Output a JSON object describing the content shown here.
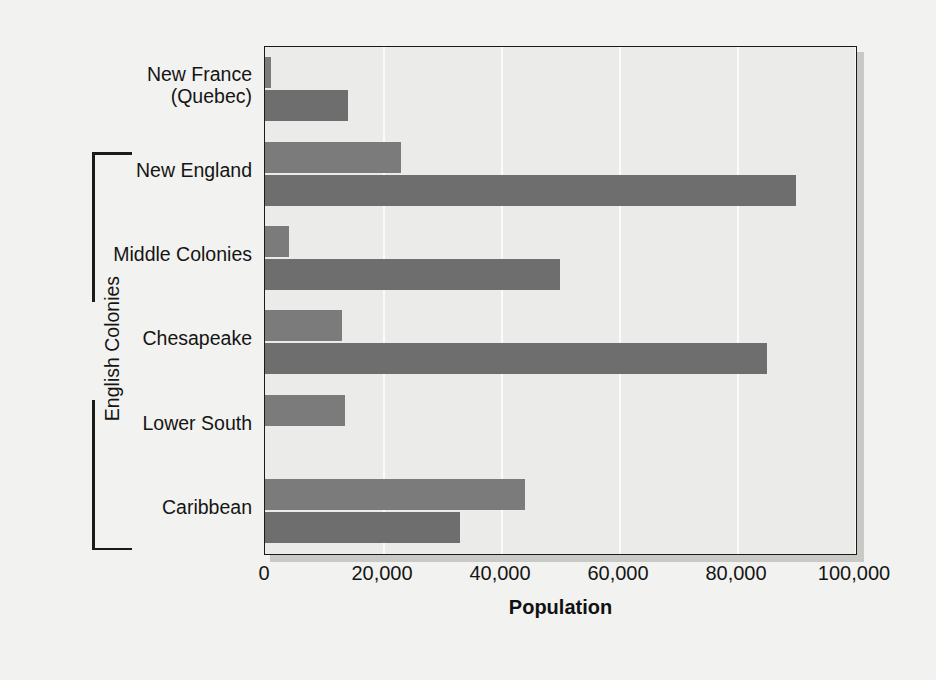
{
  "chart_data": {
    "type": "bar",
    "orientation": "horizontal",
    "title": "",
    "xlabel": "Population",
    "ylabel": "",
    "xlim": [
      0,
      100000
    ],
    "xticks": [
      0,
      20000,
      40000,
      60000,
      80000,
      100000
    ],
    "xtick_labels": [
      "0",
      "20,000",
      "40,000",
      "60,000",
      "80,000",
      "100,000"
    ],
    "grid": true,
    "grid_axis": "x",
    "legend_position": "top-right",
    "categories": [
      "New France (Quebec)",
      "New England",
      "Middle Colonies",
      "Chesapeake",
      "Lower South",
      "Caribbean"
    ],
    "category_lines": [
      [
        "New France",
        "(Quebec)"
      ],
      [
        "New England"
      ],
      [
        "Middle Colonies"
      ],
      [
        "Chesapeake"
      ],
      [
        "Lower South"
      ],
      [
        "Caribbean"
      ]
    ],
    "series": [
      {
        "name": "1650",
        "color": "#7b7b7b",
        "values": [
          1000,
          23000,
          4000,
          13000,
          13500,
          44000
        ]
      },
      {
        "name": "1700",
        "color": "#6e6e6e",
        "values": [
          14000,
          90000,
          50000,
          85000,
          0,
          33000
        ]
      }
    ],
    "annotations": [
      {
        "type": "bracket",
        "label": "English Colonies",
        "spans_categories": [
          "New England",
          "Middle Colonies",
          "Chesapeake",
          "Lower South",
          "Caribbean"
        ]
      }
    ]
  },
  "legend": {
    "items": [
      {
        "label": "1650"
      },
      {
        "label": "1700"
      }
    ]
  },
  "axis": {
    "xlabel": "Population"
  },
  "bracket": {
    "label": "English Colonies"
  },
  "colors": {
    "figure_background": "#f2f2f0",
    "plot_background": "#ebebe9",
    "frame": "#1b1b1b",
    "gridline": "#fbfbfa",
    "series_1650": "#7b7b7b",
    "series_1700": "#6e6e6e",
    "text": "#151515"
  }
}
